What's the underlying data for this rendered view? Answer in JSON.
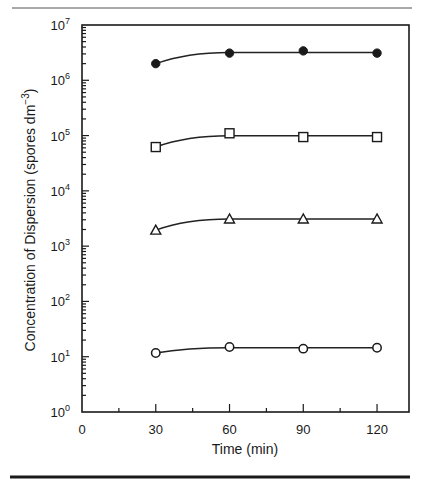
{
  "figure": {
    "top_rule": true,
    "bottom_rule": true
  },
  "chart_data": {
    "type": "line",
    "title": "",
    "xlabel": "Time (min)",
    "ylabel": "Concentration of Dispersion (spores dm⁻³)",
    "ylabel_parts": {
      "main": "Concentration of Dispersion (spores dm",
      "sup": "−3",
      "close": ")"
    },
    "xscale": "linear",
    "yscale": "log",
    "xlim": [
      0,
      133
    ],
    "ylim": [
      1,
      10000000
    ],
    "grid": false,
    "legend": "none",
    "x_ticks": [
      0,
      30,
      60,
      90,
      120
    ],
    "x_tick_labels": [
      "0",
      "30",
      "60",
      "90",
      "120"
    ],
    "x_minor_ticks": [
      15,
      45,
      75,
      105
    ],
    "y_ticks": [
      {
        "exp": 0,
        "label_base": "10",
        "label_exp": "0"
      },
      {
        "exp": 1,
        "label_base": "10",
        "label_exp": "1"
      },
      {
        "exp": 2,
        "label_base": "10",
        "label_exp": "2"
      },
      {
        "exp": 3,
        "label_base": "10",
        "label_exp": "3"
      },
      {
        "exp": 4,
        "label_base": "10",
        "label_exp": "4"
      },
      {
        "exp": 5,
        "label_base": "10",
        "label_exp": "5"
      },
      {
        "exp": 6,
        "label_base": "10",
        "label_exp": "6"
      },
      {
        "exp": 7,
        "label_base": "10",
        "label_exp": "7"
      }
    ],
    "x": [
      30,
      60,
      90,
      120
    ],
    "series": [
      {
        "name": "filled-circle series",
        "marker": "filled-circle",
        "values": [
          2000000,
          3100000,
          3400000,
          3100000
        ]
      },
      {
        "name": "open-square series",
        "marker": "open-square",
        "values": [
          62000,
          110000,
          94000,
          94000
        ]
      },
      {
        "name": "open-triangle series",
        "marker": "open-triangle",
        "values": [
          1950,
          3100,
          3100,
          3100
        ]
      },
      {
        "name": "open-circle series",
        "marker": "open-circle",
        "values": [
          11.7,
          15,
          14,
          14.5
        ]
      }
    ]
  },
  "colors": {
    "ink": "#1a1a1a",
    "background": "#ffffff"
  }
}
